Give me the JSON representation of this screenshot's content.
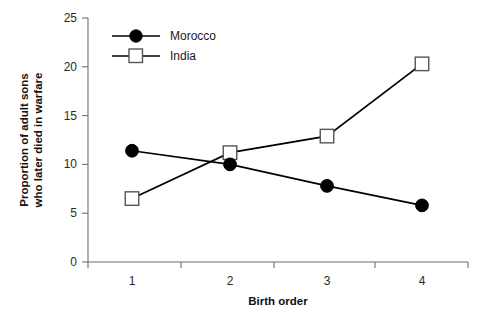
{
  "chart_data": {
    "type": "line",
    "title": "",
    "subtitle": "",
    "xlabel": "Birth order",
    "ylabel": "Proportion of adult sons who later died in warfare",
    "ylabel_line1": "Proportion of adult sons",
    "ylabel_line2": "who later died in warfare",
    "x": [
      1,
      2,
      3,
      4
    ],
    "xtick_labels": [
      "1",
      "2",
      "3",
      "4"
    ],
    "ytick_labels": [
      "0",
      "5",
      "10",
      "15",
      "20",
      "25"
    ],
    "yticks": [
      0,
      5,
      10,
      15,
      20,
      25
    ],
    "xlim": [
      0.5,
      4.5
    ],
    "ylim": [
      0,
      25
    ],
    "grid": false,
    "legend_position": "top-left-inside",
    "series": [
      {
        "name": "Morocco",
        "marker": "filled-circle",
        "color": "#000000",
        "values": [
          11.4,
          10.0,
          7.8,
          5.8
        ]
      },
      {
        "name": "India",
        "marker": "open-square",
        "color": "#000000",
        "values": [
          6.5,
          11.2,
          12.9,
          20.3
        ]
      }
    ]
  },
  "legend": {
    "entries": [
      {
        "label": "Morocco",
        "marker": "filled-circle"
      },
      {
        "label": "India",
        "marker": "open-square"
      }
    ]
  },
  "axes": {
    "x_title": "Birth order",
    "y_title_line1": "Proportion of adult sons",
    "y_title_line2": "who later died in warfare"
  }
}
